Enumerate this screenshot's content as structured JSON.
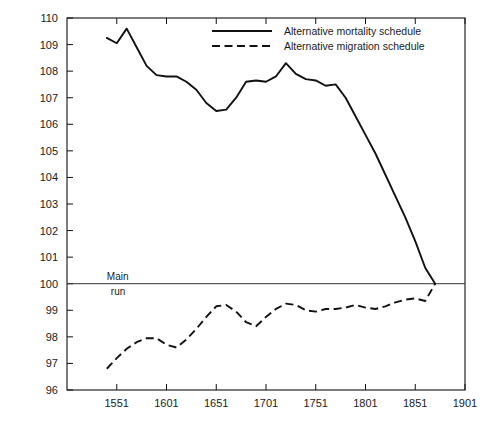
{
  "chart_data": {
    "type": "line",
    "title": "",
    "subtitle": "",
    "xlabel": "",
    "ylabel": "",
    "xlim": [
      1501,
      1901
    ],
    "ylim": [
      96,
      110
    ],
    "grid": false,
    "legend_position": "top-right",
    "x_ticks": [
      1551,
      1601,
      1651,
      1701,
      1751,
      1801,
      1851,
      1901
    ],
    "x_tick_labels": [
      "1551",
      "1601",
      "1651",
      "1701",
      "1751",
      "1801",
      "1851",
      "1901"
    ],
    "y_ticks": [
      96,
      97,
      98,
      99,
      100,
      101,
      102,
      103,
      104,
      105,
      106,
      107,
      108,
      109,
      110
    ],
    "y_tick_labels": [
      "96",
      "97",
      "98",
      "99",
      "100",
      "101",
      "102",
      "103",
      "104",
      "105",
      "106",
      "107",
      "108",
      "109",
      "110"
    ],
    "annotations": [
      {
        "name": "main-run-baseline",
        "text_line1": "Main",
        "text_line2": "run",
        "y_value": 100,
        "x_value": 1541
      }
    ],
    "series": [
      {
        "name": "Alternative mortality schedule",
        "style": "solid",
        "color": "#111111",
        "x": [
          1541,
          1551,
          1561,
          1571,
          1581,
          1591,
          1601,
          1611,
          1621,
          1631,
          1641,
          1651,
          1661,
          1671,
          1681,
          1691,
          1701,
          1711,
          1721,
          1731,
          1741,
          1751,
          1761,
          1771,
          1781,
          1791,
          1801,
          1811,
          1821,
          1831,
          1841,
          1851,
          1861,
          1871
        ],
        "y": [
          109.25,
          109.05,
          109.6,
          108.9,
          108.2,
          107.85,
          107.8,
          107.8,
          107.6,
          107.3,
          106.8,
          106.5,
          106.55,
          107.0,
          107.6,
          107.65,
          107.6,
          107.8,
          108.3,
          107.9,
          107.7,
          107.65,
          107.45,
          107.5,
          107.0,
          106.3,
          105.6,
          104.9,
          104.1,
          103.3,
          102.5,
          101.6,
          100.6,
          100.0
        ]
      },
      {
        "name": "Alternative migration schedule",
        "style": "dashed",
        "color": "#111111",
        "x": [
          1541,
          1551,
          1561,
          1571,
          1581,
          1591,
          1601,
          1611,
          1621,
          1631,
          1641,
          1651,
          1661,
          1671,
          1681,
          1691,
          1701,
          1711,
          1721,
          1731,
          1741,
          1751,
          1761,
          1771,
          1781,
          1791,
          1801,
          1811,
          1821,
          1831,
          1841,
          1851,
          1861,
          1871
        ],
        "y": [
          96.8,
          97.2,
          97.55,
          97.8,
          97.95,
          97.95,
          97.7,
          97.6,
          97.9,
          98.3,
          98.75,
          99.15,
          99.2,
          98.95,
          98.55,
          98.4,
          98.75,
          99.05,
          99.25,
          99.2,
          99.0,
          98.95,
          99.05,
          99.05,
          99.1,
          99.2,
          99.1,
          99.05,
          99.15,
          99.3,
          99.4,
          99.45,
          99.35,
          100.0
        ]
      }
    ]
  },
  "legend": {
    "entries": [
      {
        "label": "Alternative mortality schedule",
        "style": "solid"
      },
      {
        "label": "Alternative migration schedule",
        "style": "dashed"
      }
    ]
  }
}
